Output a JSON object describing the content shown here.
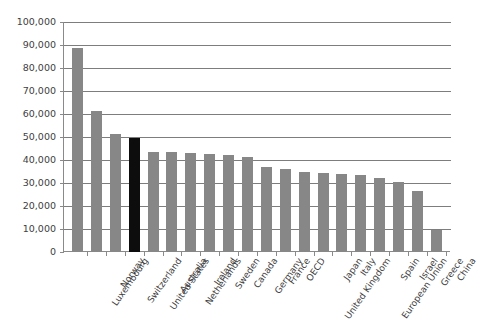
{
  "chart_data": {
    "type": "bar",
    "title": "",
    "subtitle": "",
    "xlabel": "",
    "ylabel": "",
    "ylim": [
      0,
      100000
    ],
    "ytick_step": 10000,
    "grid": true,
    "legend": "none",
    "bar_color": "#878787",
    "highlight_color": "#0d0d0d",
    "highlight_category": "United States",
    "ytick_labels": [
      "100,000",
      "90,000",
      "80,000",
      "70,000",
      "60,000",
      "50,000",
      "40,000",
      "30,000",
      "20,000",
      "10,000",
      "0"
    ],
    "categories": [
      "Luxembourg",
      "Norway",
      "Switzerland",
      "United States",
      "Australia",
      "Netherlands",
      "Ireland",
      "Sweden",
      "Canada",
      "Germany",
      "France",
      "OECD",
      "United Kingdom",
      "Japan",
      "Italy",
      "European Union",
      "Spain",
      "Israel",
      "Greece",
      "China"
    ],
    "values": [
      88500,
      61500,
      51500,
      49500,
      43500,
      43500,
      43000,
      42500,
      42000,
      41500,
      37000,
      36000,
      35000,
      34500,
      34000,
      33500,
      32000,
      30500,
      26500,
      9500
    ]
  }
}
